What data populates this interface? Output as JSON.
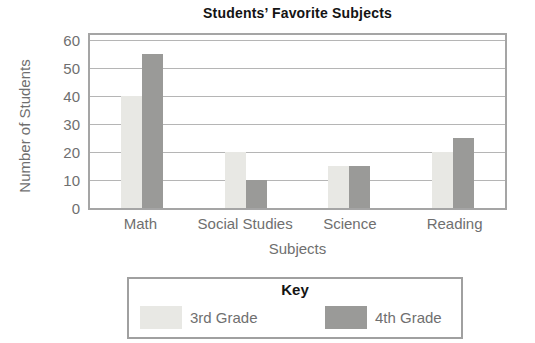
{
  "page": {
    "background": "#ffffff"
  },
  "chart_data": {
    "type": "bar",
    "title": "Students’ Favorite Subjects",
    "xlabel": "Subjects",
    "ylabel": "Number of Students",
    "categories": [
      "Math",
      "Social Studies",
      "Science",
      "Reading"
    ],
    "series": [
      {
        "name": "3rd Grade",
        "color": "#e8e8e4",
        "values": [
          40,
          20,
          15,
          20
        ]
      },
      {
        "name": "4th Grade",
        "color": "#9a9a98",
        "values": [
          55,
          10,
          15,
          25
        ]
      }
    ],
    "ylim": [
      0,
      60
    ],
    "yticks": [
      0,
      10,
      20,
      30,
      40,
      50,
      60
    ],
    "grid": "horizontal",
    "legend": {
      "title": "Key",
      "position": "bottom"
    },
    "colors": {
      "grid_line": "#b5b5b5",
      "plot_border": "#a5a5a5",
      "axis_text": "#6f6f6f",
      "title_text": "#141414"
    }
  }
}
